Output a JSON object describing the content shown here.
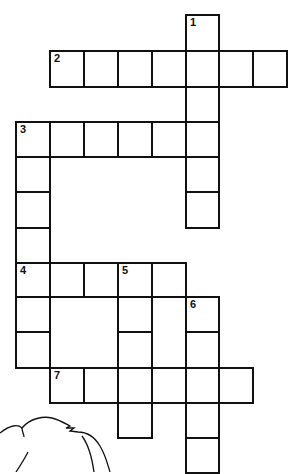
{
  "puzzle": {
    "type": "crossword",
    "cell_size": 34,
    "col_x": [
      16,
      50,
      84,
      118,
      152,
      186,
      219,
      253
    ],
    "row_y": [
      15,
      51,
      87,
      122,
      157,
      192,
      228,
      263,
      297,
      332,
      368,
      403,
      438
    ],
    "colors": {
      "line": "#111111",
      "background": "#ffffff"
    },
    "entries": [
      {
        "number": "1",
        "direction": "down",
        "row": 0,
        "col": 5,
        "length": 6
      },
      {
        "number": "2",
        "direction": "across",
        "row": 1,
        "col": 1,
        "length": 7
      },
      {
        "number": "3",
        "direction": "across",
        "row": 3,
        "col": 0,
        "length": 6
      },
      {
        "number": "3",
        "direction": "down",
        "row": 3,
        "col": 0,
        "length": 7
      },
      {
        "number": "4",
        "direction": "across",
        "row": 7,
        "col": 0,
        "length": 5
      },
      {
        "number": "5",
        "direction": "down",
        "row": 7,
        "col": 3,
        "length": 5
      },
      {
        "number": "6",
        "direction": "down",
        "row": 8,
        "col": 5,
        "length": 5
      },
      {
        "number": "7",
        "direction": "across",
        "row": 10,
        "col": 1,
        "length": 6
      }
    ]
  },
  "illustration": {
    "name": "animal-line-drawing",
    "position": "bottom-left"
  }
}
